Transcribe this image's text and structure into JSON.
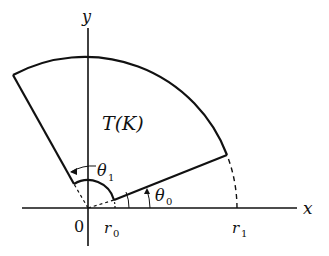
{
  "diagram": {
    "type": "polar-region",
    "region_label": "T(K)",
    "axes": {
      "x_label": "x",
      "y_label": "y",
      "origin_label": "0"
    },
    "radii": {
      "inner_label": "r",
      "inner_sub": "0",
      "outer_label": "r",
      "outer_sub": "1"
    },
    "angles": {
      "start_label": "θ",
      "start_sub": "0",
      "end_label": "θ",
      "end_sub": "1"
    },
    "colors": {
      "stroke": "#111111",
      "background": "#ffffff"
    }
  }
}
